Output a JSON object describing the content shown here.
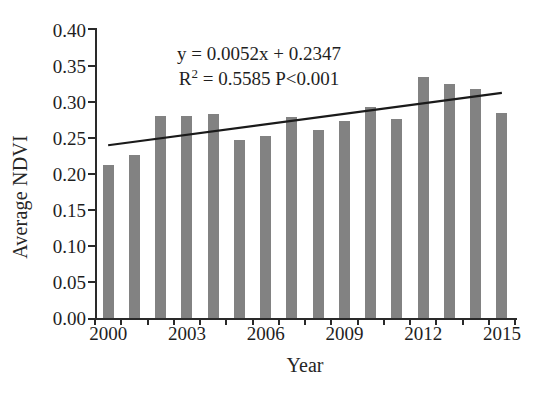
{
  "chart_data": {
    "type": "bar",
    "title": "",
    "xlabel": "Year",
    "ylabel": "Average NDVI",
    "categories": [
      2000,
      2001,
      2002,
      2003,
      2004,
      2005,
      2006,
      2007,
      2008,
      2009,
      2010,
      2011,
      2012,
      2013,
      2014,
      2015
    ],
    "values": [
      0.213,
      0.226,
      0.281,
      0.281,
      0.283,
      0.247,
      0.253,
      0.279,
      0.261,
      0.273,
      0.293,
      0.276,
      0.335,
      0.325,
      0.318,
      0.285
    ],
    "series": [
      {
        "name": "Average NDVI",
        "values": [
          0.213,
          0.226,
          0.281,
          0.281,
          0.283,
          0.247,
          0.253,
          0.279,
          0.261,
          0.273,
          0.293,
          0.276,
          0.335,
          0.325,
          0.318,
          0.285
        ]
      }
    ],
    "ylim": [
      0.0,
      0.4
    ],
    "ytick_step": 0.05,
    "ytick_labels": [
      "0.40",
      "0.35",
      "0.30",
      "0.25",
      "0.20",
      "0.15",
      "0.10",
      "0.05",
      "0.00"
    ],
    "ytick_values": [
      0.4,
      0.35,
      0.3,
      0.25,
      0.2,
      0.15,
      0.1,
      0.05,
      0.0
    ],
    "xtick_labels": [
      "2000",
      "2003",
      "2006",
      "2009",
      "2012",
      "2015"
    ],
    "xtick_values": [
      2000,
      2003,
      2006,
      2009,
      2012,
      2015
    ],
    "grid": false,
    "legend": false,
    "bar_color": "#828282",
    "axis_color": "#2a2a2a",
    "trendline": {
      "type": "linear",
      "color": "#1a1a1a",
      "slope": 0.0052,
      "intercept": 0.2347,
      "start_value": 0.2399,
      "end_value": 0.3127
    },
    "annotations": {
      "equation": "y = 0.0052x + 0.2347",
      "fit_stats_prefix": "R",
      "fit_stats_sup": "2",
      "fit_stats": " = 0.5585 P<0.001",
      "r_squared": 0.5585,
      "p_value": "P<0.001"
    }
  }
}
